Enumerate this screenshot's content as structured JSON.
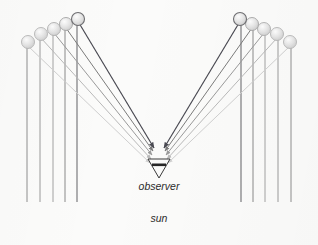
{
  "figure": {
    "background_color": "#fbfbfa",
    "width": 318,
    "height": 245
  },
  "labels": {
    "observer": "observer",
    "sun": "sun"
  },
  "observer_marker": {
    "name": "observer-triangle",
    "apex_x": 159,
    "apex_y": 178,
    "top_y": 159,
    "half_width": 11,
    "bar_color": "#262626",
    "outline_color": "#3a3a3a"
  },
  "convergence": {
    "left_x": 152,
    "right_x": 166,
    "y_top": 148,
    "y_bottom": 164
  },
  "ray_colors": [
    "#cfcfcf",
    "#b9b9b9",
    "#9a9a9a",
    "#7b7b7b",
    "#4a4a52"
  ],
  "drop_fill": "#e2e2e2",
  "drop_edge": "#b5b5b5",
  "vertical_line_color": "#8e8e8e",
  "vertical_line_bottom": 202,
  "left_group": {
    "name": "left-raindrop-column",
    "drops": [
      {
        "x": 28,
        "y": 42,
        "r": 6.5,
        "ray_index": 0,
        "line_x": 27
      },
      {
        "x": 41,
        "y": 34,
        "r": 6.5,
        "ray_index": 1,
        "line_x": 40
      },
      {
        "x": 54,
        "y": 29,
        "r": 6.5,
        "ray_index": 2,
        "line_x": 53
      },
      {
        "x": 66,
        "y": 24,
        "r": 6.5,
        "ray_index": 3,
        "line_x": 65
      },
      {
        "x": 78,
        "y": 19,
        "r": 6.5,
        "ray_index": 4,
        "line_x": 77
      }
    ]
  },
  "right_group": {
    "name": "right-raindrop-column",
    "drops": [
      {
        "x": 290,
        "y": 42,
        "r": 6.5,
        "ray_index": 0,
        "line_x": 291
      },
      {
        "x": 277,
        "y": 34,
        "r": 6.5,
        "ray_index": 1,
        "line_x": 278
      },
      {
        "x": 264,
        "y": 29,
        "r": 6.5,
        "ray_index": 2,
        "line_x": 265
      },
      {
        "x": 252,
        "y": 24,
        "r": 6.5,
        "ray_index": 3,
        "line_x": 253
      },
      {
        "x": 240,
        "y": 19,
        "r": 6.5,
        "ray_index": 4,
        "line_x": 241
      }
    ]
  }
}
